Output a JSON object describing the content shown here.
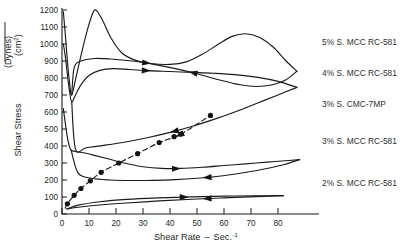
{
  "axes": {
    "y_title_main": "Shear Stress",
    "y_title_num": "(Dynes)",
    "y_title_den": "(cm",
    "y_title_den_sup": "2",
    "y_title_den_close": ")",
    "x_title_main": "Shear Rate",
    "x_title_dash": "–",
    "x_title_unit": "Sec.",
    "x_title_exp": "-1",
    "y_ticks": [
      "0",
      "100",
      "200",
      "300",
      "400",
      "500",
      "600",
      "700",
      "800",
      "900",
      "1000",
      "1100",
      "1200"
    ],
    "x_ticks": [
      "0",
      "10",
      "20",
      "30",
      "40",
      "50",
      "60",
      "70",
      "80"
    ]
  },
  "series_labels": [
    "5% S. MCC RC-581",
    "4% S. MCC RC-581",
    "3% S. CMC-7MP",
    "3% S. MCC RC-581",
    "2% S. MCC RC-581"
  ],
  "colors": {
    "ink": "#1a1a1a",
    "text": "#262626",
    "background": "#ffffff"
  },
  "chart_data": {
    "type": "line",
    "title": "",
    "xlabel": "Shear Rate – Sec.-1",
    "ylabel": "Shear Stress (Dynes)/(cm2)",
    "xlim": [
      0,
      90
    ],
    "ylim": [
      0,
      1200
    ],
    "grid": false,
    "legend": "right-of-axes",
    "series": [
      {
        "name": "5% S. MCC RC-581",
        "label_y": 1010,
        "style": "solid",
        "arrow_down_x": 33,
        "arrow_up_x": 47,
        "down_curve": [
          [
            0.5,
            1190
          ],
          [
            1.2,
            1060
          ],
          [
            2.0,
            900
          ],
          [
            2.8,
            770
          ],
          [
            3.6,
            700
          ],
          [
            5.0,
            790
          ],
          [
            7.0,
            930
          ],
          [
            9.0,
            1060
          ],
          [
            11.0,
            1165
          ],
          [
            12.5,
            1200
          ],
          [
            15.0,
            1140
          ],
          [
            18.0,
            1040
          ],
          [
            22.0,
            950
          ],
          [
            27.0,
            905
          ],
          [
            33.0,
            885
          ],
          [
            40.0,
            880
          ],
          [
            46.0,
            895
          ],
          [
            52.0,
            940
          ],
          [
            58.0,
            1000
          ],
          [
            63.0,
            1045
          ],
          [
            68.0,
            1060
          ],
          [
            73.0,
            1040
          ],
          [
            78.0,
            985
          ],
          [
            83.0,
            900
          ],
          [
            87.0,
            840
          ]
        ],
        "up_curve": [
          [
            87.0,
            840
          ],
          [
            83.0,
            790
          ],
          [
            78.0,
            760
          ],
          [
            72.0,
            750
          ],
          [
            66.0,
            760
          ],
          [
            58.0,
            790
          ],
          [
            50.0,
            825
          ],
          [
            42.0,
            855
          ],
          [
            34.0,
            880
          ],
          [
            26.0,
            900
          ],
          [
            18.0,
            912
          ],
          [
            12.0,
            915
          ],
          [
            7.0,
            900
          ],
          [
            4.5,
            860
          ],
          [
            3.6,
            700
          ]
        ]
      },
      {
        "name": "4% S. MCC RC-581",
        "label_y": 830,
        "style": "solid",
        "arrow_down_x": 33,
        "arrow_up_x": 40,
        "down_curve": [
          [
            0.5,
            1000
          ],
          [
            1.2,
            930
          ],
          [
            2.0,
            820
          ],
          [
            2.8,
            720
          ],
          [
            3.6,
            660
          ],
          [
            5.0,
            700
          ],
          [
            7.0,
            760
          ],
          [
            10.0,
            815
          ],
          [
            14.0,
            845
          ],
          [
            19.0,
            855
          ],
          [
            25.0,
            850
          ],
          [
            32.0,
            843
          ],
          [
            40.0,
            838
          ],
          [
            48.0,
            833
          ],
          [
            56.0,
            828
          ],
          [
            64.0,
            820
          ],
          [
            72.0,
            805
          ],
          [
            80.0,
            780
          ],
          [
            87.0,
            745
          ]
        ],
        "up_curve": [
          [
            87.0,
            745
          ],
          [
            80.0,
            700
          ],
          [
            72.0,
            650
          ],
          [
            64.0,
            600
          ],
          [
            56.0,
            555
          ],
          [
            48.0,
            515
          ],
          [
            40.0,
            480
          ],
          [
            32.0,
            450
          ],
          [
            24.0,
            425
          ],
          [
            16.0,
            405
          ],
          [
            9.0,
            390
          ],
          [
            5.0,
            382
          ],
          [
            3.6,
            660
          ]
        ]
      },
      {
        "name": "3% S. CMC-7MP",
        "label_y": 650,
        "style": "dashed",
        "arrow_x": 42,
        "markers": [
          [
            2.0,
            60
          ],
          [
            4.5,
            110
          ],
          [
            7.0,
            150
          ],
          [
            10.5,
            195
          ],
          [
            14.5,
            245
          ],
          [
            21.0,
            300
          ],
          [
            28.0,
            355
          ],
          [
            36.0,
            420
          ],
          [
            41.5,
            455
          ],
          [
            44.0,
            470
          ],
          [
            55.0,
            580
          ]
        ],
        "line": [
          [
            1.2,
            35
          ],
          [
            2.0,
            60
          ],
          [
            4.5,
            110
          ],
          [
            7.0,
            150
          ],
          [
            10.5,
            195
          ],
          [
            14.5,
            245
          ],
          [
            21.0,
            300
          ],
          [
            28.0,
            355
          ],
          [
            36.0,
            420
          ],
          [
            44.0,
            470
          ],
          [
            55.0,
            580
          ]
        ]
      },
      {
        "name": "3% S. MCC RC-581",
        "label_y": 430,
        "style": "solid",
        "arrow_down_x": 44,
        "arrow_up_x": 52,
        "down_curve": [
          [
            0.5,
            620
          ],
          [
            1.0,
            560
          ],
          [
            1.8,
            470
          ],
          [
            2.6,
            405
          ],
          [
            3.4,
            375
          ],
          [
            5.0,
            368
          ],
          [
            8.0,
            360
          ],
          [
            12.0,
            345
          ],
          [
            17.0,
            325
          ],
          [
            23.0,
            300
          ],
          [
            30.0,
            278
          ],
          [
            37.0,
            268
          ],
          [
            44.0,
            268
          ],
          [
            52.0,
            275
          ],
          [
            60.0,
            285
          ],
          [
            68.0,
            295
          ],
          [
            76.0,
            305
          ],
          [
            84.0,
            315
          ],
          [
            88.0,
            320
          ]
        ],
        "up_curve": [
          [
            88.0,
            320
          ],
          [
            82.0,
            290
          ],
          [
            74.0,
            262
          ],
          [
            66.0,
            240
          ],
          [
            58.0,
            222
          ],
          [
            50.0,
            210
          ],
          [
            42.0,
            202
          ],
          [
            34.0,
            198
          ],
          [
            26.0,
            197
          ],
          [
            18.0,
            200
          ],
          [
            11.0,
            210
          ],
          [
            6.0,
            240
          ],
          [
            3.4,
            375
          ]
        ]
      },
      {
        "name": "2% S. MCC RC-581",
        "label_y": 180,
        "style": "solid",
        "arrow_down_x": 47,
        "arrow_up_x": 52,
        "down_curve": [
          [
            1.8,
            30
          ],
          [
            6.0,
            52
          ],
          [
            14.0,
            72
          ],
          [
            24.0,
            86
          ],
          [
            36.0,
            95
          ],
          [
            48.0,
            101
          ],
          [
            60.0,
            105
          ],
          [
            72.0,
            107
          ],
          [
            82.0,
            108
          ]
        ],
        "up_curve": [
          [
            82.0,
            108
          ],
          [
            72.0,
            102
          ],
          [
            60.0,
            95
          ],
          [
            48.0,
            87
          ],
          [
            36.0,
            77
          ],
          [
            24.0,
            65
          ],
          [
            14.0,
            53
          ],
          [
            6.0,
            40
          ],
          [
            1.8,
            30
          ]
        ]
      }
    ]
  }
}
